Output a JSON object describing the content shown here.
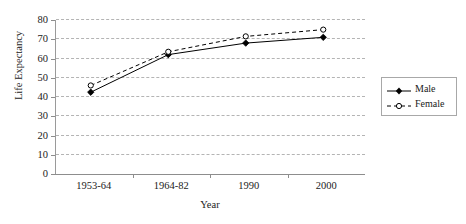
{
  "chart_data": {
    "type": "line",
    "title": "",
    "xlabel": "Year",
    "ylabel": "Life Expectancy",
    "categories": [
      "1953-64",
      "1964-82",
      "1990",
      "2000"
    ],
    "series": [
      {
        "name": "Male",
        "values": [
          42.5,
          62,
          68,
          71
        ],
        "style": "solid",
        "marker": "filled-diamond",
        "color": "#000000"
      },
      {
        "name": "Female",
        "values": [
          46,
          63.5,
          71.5,
          75
        ],
        "style": "dashed",
        "marker": "open-circle",
        "color": "#000000"
      }
    ],
    "ylim": [
      0,
      80
    ],
    "yticks": [
      0,
      10,
      20,
      30,
      40,
      50,
      60,
      70,
      80
    ],
    "ytick_labels": [
      "0",
      "10",
      "20",
      "30",
      "40",
      "50",
      "60",
      "70",
      "80"
    ],
    "grid": "horizontal-dashed",
    "legend_position": "right",
    "legend_entries": [
      "Male",
      "Female"
    ],
    "gridline_color": "#b4b4b4",
    "axis_color": "#8d8d8d"
  }
}
